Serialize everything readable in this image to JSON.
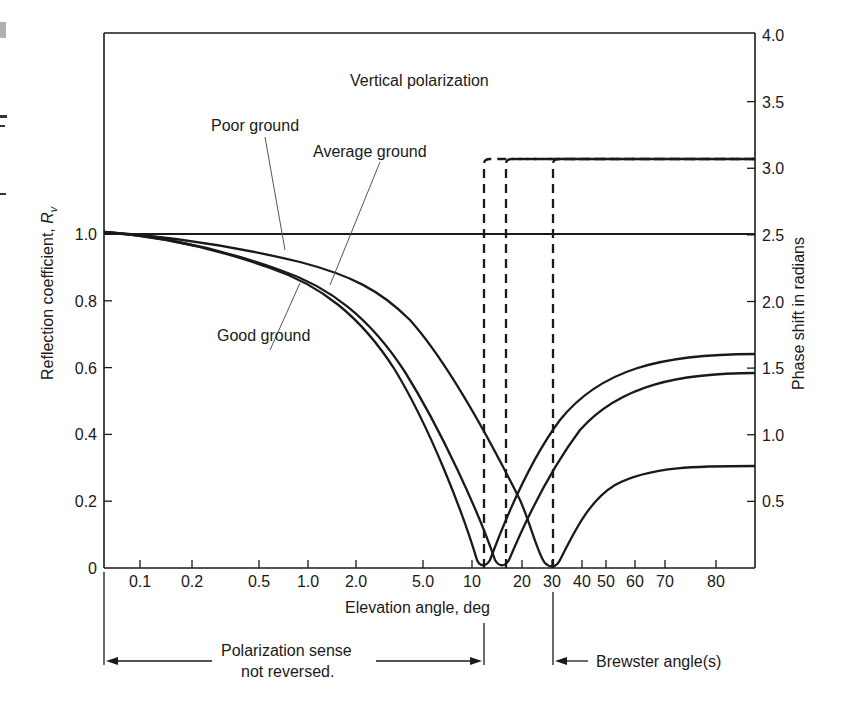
{
  "chart_data": {
    "type": "line",
    "title": "Vertical polarization",
    "xlabel": "Elevation angle, deg",
    "ylabel": "Reflection coefficient, R",
    "ylabel_subscript": "v",
    "ylabel_right": "Phase shift in radians",
    "x_scale": "nonlinear (log-like at small angles)",
    "x_ticks": [
      {
        "label": "0.1",
        "value": 0.1,
        "px": 140
      },
      {
        "label": "0.2",
        "value": 0.2,
        "px": 192
      },
      {
        "label": "0.5",
        "value": 0.5,
        "px": 259
      },
      {
        "label": "1.0",
        "value": 1.0,
        "px": 308
      },
      {
        "label": "2.0",
        "value": 2.0,
        "px": 356
      },
      {
        "label": "5.0",
        "value": 5.0,
        "px": 423
      },
      {
        "label": "10",
        "value": 10,
        "px": 472
      },
      {
        "label": "20",
        "value": 20,
        "px": 522
      },
      {
        "label": "30",
        "value": 30,
        "px": 552
      },
      {
        "label": "40",
        "value": 40,
        "px": 582
      },
      {
        "label": "50",
        "value": 50,
        "px": 606
      },
      {
        "label": "60",
        "value": 60,
        "px": 635
      },
      {
        "label": "70",
        "value": 70,
        "px": 665
      },
      {
        "label": "80",
        "value": 80,
        "px": 716
      }
    ],
    "y_ticks": [
      "0",
      "0.2",
      "0.4",
      "0.6",
      "0.8",
      "1.0"
    ],
    "ylim": [
      0,
      1.0
    ],
    "y_right_ticks": [
      "0.5",
      "1.0",
      "1.5",
      "2.0",
      "2.5",
      "3.0",
      "3.5",
      "4.0"
    ],
    "ylim_right": [
      0,
      4.0
    ],
    "grid": false,
    "legend": "none (curves labeled inline)",
    "series": [
      {
        "name": "Good ground",
        "kind": "reflection coefficient",
        "x": [
          0.07,
          0.1,
          0.2,
          0.5,
          1.0,
          2.0,
          5.0,
          8.0,
          10,
          12,
          15,
          20,
          30,
          50,
          70,
          90
        ],
        "values": [
          1.0,
          0.99,
          0.97,
          0.93,
          0.87,
          0.78,
          0.5,
          0.2,
          0.05,
          0.0,
          0.1,
          0.3,
          0.45,
          0.55,
          0.6,
          0.62
        ]
      },
      {
        "name": "Average ground",
        "kind": "reflection coefficient",
        "x": [
          0.07,
          0.1,
          0.2,
          0.5,
          1.0,
          2.0,
          5.0,
          10,
          13,
          15,
          20,
          30,
          50,
          70,
          90
        ],
        "values": [
          1.0,
          0.99,
          0.98,
          0.94,
          0.89,
          0.8,
          0.55,
          0.18,
          0.03,
          0.0,
          0.15,
          0.35,
          0.5,
          0.56,
          0.57
        ]
      },
      {
        "name": "Poor ground",
        "kind": "reflection coefficient",
        "x": [
          0.07,
          0.1,
          0.2,
          0.5,
          1.0,
          2.0,
          5.0,
          10,
          20,
          28,
          30,
          40,
          60,
          90
        ],
        "values": [
          1.0,
          0.99,
          0.98,
          0.96,
          0.93,
          0.88,
          0.68,
          0.38,
          0.08,
          0.0,
          0.02,
          0.15,
          0.27,
          0.3
        ]
      },
      {
        "name": "Phase shift (good ground)",
        "kind": "phase shift, radians",
        "style": "dashed",
        "x": [
          0.07,
          11.5,
          11.5,
          90
        ],
        "values": [
          0.0,
          0.0,
          3.14,
          3.14
        ]
      },
      {
        "name": "Phase shift (average ground)",
        "kind": "phase shift, radians",
        "style": "dashed",
        "x": [
          0.07,
          15,
          15,
          90
        ],
        "values": [
          0.0,
          0.0,
          3.14,
          3.14
        ]
      },
      {
        "name": "Phase shift (poor ground)",
        "kind": "phase shift, radians",
        "style": "dashed",
        "x": [
          0.07,
          29,
          29,
          90
        ],
        "values": [
          0.0,
          0.0,
          3.14,
          3.14
        ]
      }
    ],
    "reference_line": {
      "label": "R = 1.0 / phase 2.5 rad",
      "y": 1.0
    },
    "annotations": [
      {
        "text": "Vertical polarization"
      },
      {
        "text": "Poor ground"
      },
      {
        "text": "Average ground"
      },
      {
        "text": "Good ground"
      },
      {
        "text": "Polarization sense",
        "text2": "not reversed."
      },
      {
        "text": "Brewster angle(s)"
      }
    ]
  },
  "labels": {
    "title": "Vertical polarization",
    "poor": "Poor ground",
    "average": "Average ground",
    "good": "Good ground",
    "xlabel": "Elevation angle, deg",
    "ylabel": "Reflection coefficient, ",
    "ylabel_R": "R",
    "ylabel_sub": "v",
    "ylabel_right": "Phase shift in radians",
    "pol_line1": "Polarization sense",
    "pol_line2": "not reversed.",
    "brewster": "Brewster angle(s)"
  },
  "colors": {
    "ink": "#1a1a1a",
    "leader": "#555555",
    "background": "#ffffff",
    "artifact": "#b0b0b0"
  }
}
